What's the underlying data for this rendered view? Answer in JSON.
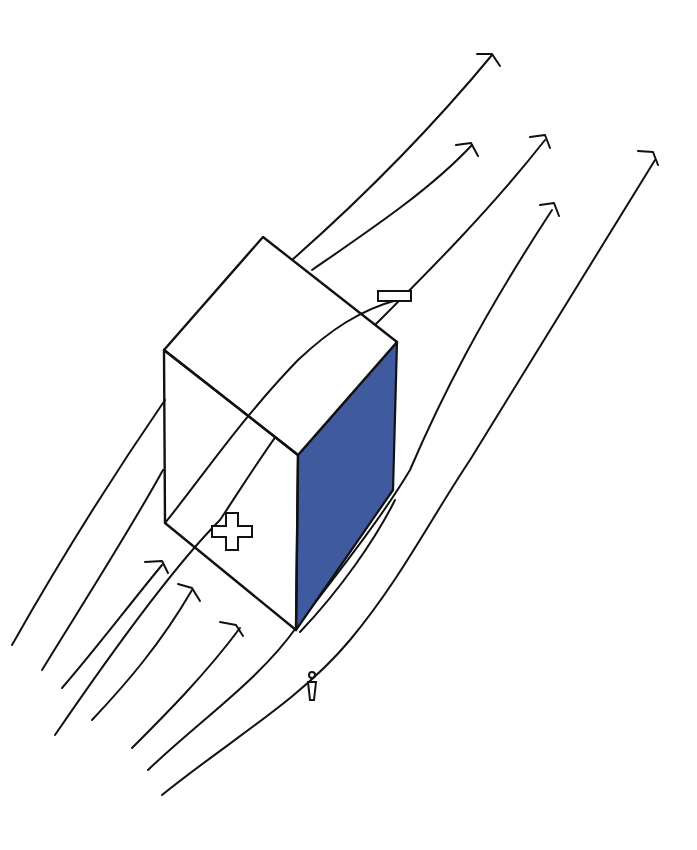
{
  "diagram": {
    "title": "Wind flow around building sketch",
    "style": "hand-drawn",
    "colors": {
      "background": "#ffffff",
      "ink": "#111111",
      "shaded_face": "#3f5a9e"
    },
    "building": {
      "shape": "rectangular block (isometric)",
      "faces": [
        "top",
        "windward-front",
        "leeward-side (shaded)"
      ]
    },
    "labels": {
      "positive_pressure": "+",
      "negative_pressure": "−"
    },
    "human_figure": "person-scale-icon",
    "wind": {
      "direction": "bottom-left to top-right",
      "streamlines_count": 12,
      "short_arrows_count": 3
    }
  }
}
